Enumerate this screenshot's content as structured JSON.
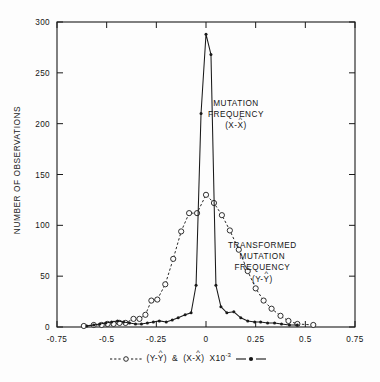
{
  "chart_data": {
    "type": "line",
    "title": "",
    "xlabel": "---o--- (Y-Ŷ) & (X-X̂) X10⁻³ —●—",
    "ylabel": "NUMBER OF OBSERVATIONS",
    "xlim": [
      -0.75,
      0.75
    ],
    "ylim": [
      0,
      300
    ],
    "xticks": [
      "-0.75",
      "-0.5",
      "-0.25",
      "0",
      "0.25",
      "0.5",
      "0.75"
    ],
    "xtick_values": [
      -0.75,
      -0.5,
      -0.25,
      0,
      0.25,
      0.5,
      0.75
    ],
    "yticks": [
      "0",
      "50",
      "100",
      "150",
      "200",
      "250",
      "300"
    ],
    "ytick_values": [
      0,
      50,
      100,
      150,
      200,
      250,
      300
    ],
    "grid": false,
    "legend_position": "below-axis",
    "annotations": [
      {
        "name": "mutation-frequency-label",
        "lines": [
          "MUTATION",
          "FREQUENCY",
          "(X-X̂)"
        ],
        "line1": "MUTATION",
        "line2": "FREQUENCY",
        "line3_pre": "(X-",
        "line3_char": "X",
        "line3_hat": "^",
        "line3_post": ")"
      },
      {
        "name": "transformed-mutation-frequency-label",
        "lines": [
          "TRANSFORMED",
          "MUTATION",
          "FREQUENCY",
          "(Y-Ŷ)"
        ],
        "line1": "TRANSFORMED",
        "line2": "MUTATION",
        "line3": "FREQUENCY",
        "line4_pre": "(Y-",
        "line4_char": "Y",
        "line4_hat": "^",
        "line4_post": ")"
      }
    ],
    "legend_entries": [
      {
        "name": "transformed-mutation-frequency-series",
        "marker": "open-circle",
        "line": "dashed",
        "label": "(Y-Ŷ)"
      },
      {
        "name": "mutation-frequency-series",
        "marker": "filled-circle",
        "line": "solid",
        "label": "(X-X̂)"
      }
    ],
    "series": [
      {
        "name": "TRANSFORMED MUTATION FREQUENCY (Y-Yhat)",
        "style": "dashed",
        "marker": "open-circle",
        "x": [
          -0.615,
          -0.565,
          -0.525,
          -0.495,
          -0.465,
          -0.435,
          -0.405,
          -0.365,
          -0.335,
          -0.305,
          -0.275,
          -0.245,
          -0.205,
          -0.165,
          -0.125,
          -0.085,
          -0.045,
          0.0,
          0.04,
          0.08,
          0.12,
          0.165,
          0.21,
          0.25,
          0.29,
          0.33,
          0.375,
          0.415,
          0.46,
          0.54
        ],
        "y": [
          1,
          2,
          2,
          3,
          3,
          4,
          4,
          8,
          8,
          12,
          26,
          27,
          42,
          67,
          94,
          112,
          112,
          130,
          122,
          110,
          95,
          76,
          55,
          38,
          26,
          18,
          11,
          6,
          3,
          2
        ]
      },
      {
        "name": "MUTATION FREQUENCY (X-Xhat)",
        "style": "solid",
        "marker": "filled-circle",
        "x": [
          -0.6,
          -0.565,
          -0.535,
          -0.505,
          -0.475,
          -0.445,
          -0.415,
          -0.385,
          -0.355,
          -0.325,
          -0.295,
          -0.265,
          -0.235,
          -0.2,
          -0.17,
          -0.14,
          -0.105,
          -0.075,
          -0.05,
          -0.025,
          0.0,
          0.025,
          0.05,
          0.075,
          0.105,
          0.14,
          0.175,
          0.21,
          0.245,
          0.275,
          0.31,
          0.345,
          0.38,
          0.42,
          0.46
        ],
        "y": [
          1,
          2,
          3,
          4,
          5,
          6,
          5,
          4,
          3,
          3,
          4,
          5,
          6,
          5,
          7,
          9,
          12,
          14,
          41,
          210,
          288,
          268,
          41,
          20,
          14,
          15,
          9,
          6,
          5,
          5,
          4,
          4,
          3,
          2,
          2
        ]
      }
    ]
  }
}
